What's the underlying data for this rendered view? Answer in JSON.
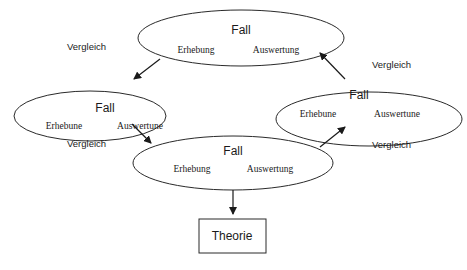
{
  "diagram": {
    "type": "cycle-flow",
    "nodes": [
      {
        "id": "top",
        "title": "Fall",
        "left": "Erhebung",
        "right": "Auswertung"
      },
      {
        "id": "left",
        "title": "Fall",
        "left": "Erhebune",
        "right": "Auswertune"
      },
      {
        "id": "bottom",
        "title": "Fall",
        "left": "Erhebung",
        "right": "Auswertung"
      },
      {
        "id": "right",
        "title": "Fall",
        "left": "Erhebune",
        "right": "Auswertune"
      }
    ],
    "comparisons": [
      {
        "id": "top-left",
        "label": "Vergleich"
      },
      {
        "id": "left-bottom",
        "label": "Vergleich"
      },
      {
        "id": "top-right",
        "label": "Vergleich"
      },
      {
        "id": "bottom-right",
        "label": "Vergleich"
      }
    ],
    "result": {
      "label": "Theorie"
    },
    "edges": [
      {
        "from": "top",
        "to": "left"
      },
      {
        "from": "left",
        "to": "bottom"
      },
      {
        "from": "bottom",
        "to": "right"
      },
      {
        "from": "right",
        "to": "top"
      },
      {
        "from": "bottom",
        "to": "result"
      }
    ],
    "colors": {
      "stroke": "#2a2a2a",
      "text": "#1a1a1a",
      "background": "#ffffff"
    }
  }
}
